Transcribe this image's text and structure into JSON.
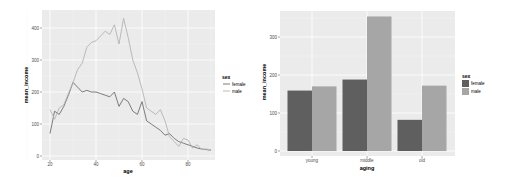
{
  "chart_data": [
    {
      "type": "line",
      "title": "",
      "xlabel": "age",
      "ylabel": "mean_income",
      "xlim": [
        18,
        92
      ],
      "ylim": [
        0,
        430
      ],
      "x_ticks": [
        20,
        40,
        60,
        80
      ],
      "y_ticks": [
        0,
        100,
        200,
        300,
        400
      ],
      "grid": true,
      "legend": {
        "title": "sex",
        "position": "right",
        "entries": [
          "female",
          "male"
        ]
      },
      "x": [
        20,
        22,
        24,
        26,
        28,
        30,
        32,
        34,
        36,
        38,
        40,
        42,
        44,
        46,
        48,
        50,
        52,
        54,
        56,
        58,
        60,
        62,
        64,
        66,
        68,
        70,
        72,
        74,
        76,
        78,
        80,
        82,
        84,
        86,
        88,
        90
      ],
      "series": [
        {
          "name": "female",
          "color": "#6e6e6e",
          "values": [
            70,
            140,
            130,
            155,
            190,
            230,
            215,
            200,
            205,
            200,
            200,
            195,
            190,
            185,
            200,
            155,
            180,
            170,
            140,
            130,
            170,
            110,
            100,
            90,
            80,
            65,
            70,
            55,
            45,
            40,
            35,
            30,
            25,
            22,
            20,
            18
          ]
        },
        {
          "name": "male",
          "color": "#b3b3b3",
          "values": [
            145,
            115,
            150,
            160,
            195,
            230,
            270,
            290,
            340,
            355,
            360,
            375,
            390,
            380,
            410,
            350,
            430,
            370,
            300,
            260,
            210,
            150,
            140,
            130,
            145,
            110,
            60,
            45,
            30,
            55,
            50,
            25,
            35,
            20,
            22,
            18
          ]
        }
      ]
    },
    {
      "type": "bar",
      "title": "",
      "xlabel": "aging",
      "ylabel": "mean_income",
      "categories": [
        "young",
        "middle",
        "old"
      ],
      "ylim": [
        0,
        370
      ],
      "y_ticks": [
        0,
        100,
        200,
        300
      ],
      "grid": true,
      "legend": {
        "title": "sex",
        "position": "right",
        "entries": [
          "female",
          "male"
        ]
      },
      "series": [
        {
          "name": "female",
          "color": "#5f5f5f",
          "values": [
            159,
            188,
            82
          ]
        },
        {
          "name": "male",
          "color": "#a6a6a6",
          "values": [
            170,
            354,
            172
          ]
        }
      ]
    }
  ],
  "left": {
    "xlabel": "age",
    "ylabel": "mean_income",
    "legend_title": "sex",
    "legend_female": "female",
    "legend_male": "male",
    "yt0": "0",
    "yt1": "100",
    "yt2": "200",
    "yt3": "300",
    "yt4": "400",
    "xt0": "20",
    "xt1": "40",
    "xt2": "60",
    "xt3": "80"
  },
  "right": {
    "xlabel": "aging",
    "ylabel": "mean_income",
    "legend_title": "sex",
    "legend_female": "female",
    "legend_male": "male",
    "yt0": "0",
    "yt1": "100",
    "yt2": "200",
    "yt3": "300",
    "xt0": "young",
    "xt1": "middle",
    "xt2": "old"
  }
}
